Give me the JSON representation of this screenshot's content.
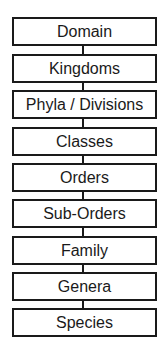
{
  "diagram": {
    "type": "vertical-hierarchy",
    "title": "",
    "levels": [
      {
        "label": "Domain"
      },
      {
        "label": "Kingdoms"
      },
      {
        "label": "Phyla / Divisions"
      },
      {
        "label": "Classes"
      },
      {
        "label": "Orders"
      },
      {
        "label": "Sub-Orders"
      },
      {
        "label": "Family"
      },
      {
        "label": "Genera"
      },
      {
        "label": "Species"
      }
    ],
    "colors": {
      "stroke": "#1a1a1a",
      "fill": "#ffffff",
      "text": "#1a1a1a"
    }
  }
}
